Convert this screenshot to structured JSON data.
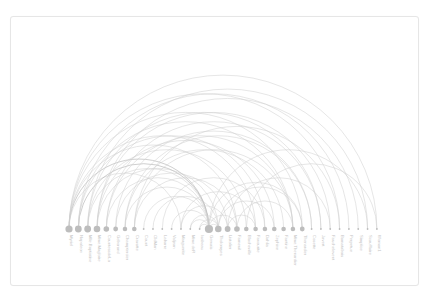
{
  "diagram": {
    "type": "arc-diagram",
    "colors": {
      "node": "#bdbdbd",
      "arc": "#cfcfcf",
      "label": "#c4c4c4",
      "border": "#e6e6e6"
    },
    "baseline_y": 229,
    "x_start": 69,
    "x_step": 9.33,
    "nodes": [
      {
        "label": "Myriel",
        "r": 3.6
      },
      {
        "label": "Napoleon",
        "r": 3.4
      },
      {
        "label": "Mlle.Baptistine",
        "r": 3.4
      },
      {
        "label": "Mme.Magloire",
        "r": 3.3
      },
      {
        "label": "CountessdeLo",
        "r": 2.8
      },
      {
        "label": "Geborand",
        "r": 2.4
      },
      {
        "label": "Champtercier",
        "r": 2.3
      },
      {
        "label": "Cravatte",
        "r": 2.3
      },
      {
        "label": "Count",
        "r": 0.9
      },
      {
        "label": "OldMan",
        "r": 0.9
      },
      {
        "label": "Labarre",
        "r": 0.9
      },
      {
        "label": "Valjean",
        "r": 0.9
      },
      {
        "label": "Marguerite",
        "r": 0.9
      },
      {
        "label": "Mme.deR",
        "r": 0.9
      },
      {
        "label": "Isabeau",
        "r": 0.9
      },
      {
        "label": "Gervais",
        "r": 4.1
      },
      {
        "label": "Tholomyes",
        "r": 3.3
      },
      {
        "label": "Listolier",
        "r": 2.9
      },
      {
        "label": "Fameuil",
        "r": 2.8
      },
      {
        "label": "Blacheville",
        "r": 2.3
      },
      {
        "label": "Favourite",
        "r": 2.3
      },
      {
        "label": "Dahlia",
        "r": 2.3
      },
      {
        "label": "Zephine",
        "r": 2.3
      },
      {
        "label": "Fantine",
        "r": 2.3
      },
      {
        "label": "Mme.Thenardier",
        "r": 2.3
      },
      {
        "label": "Thenardier",
        "r": 2.4
      },
      {
        "label": "Cosette",
        "r": 0.9
      },
      {
        "label": "Javert",
        "r": 0.9
      },
      {
        "label": "Fauchelevent",
        "r": 0.9
      },
      {
        "label": "Bamatabois",
        "r": 0.9
      },
      {
        "label": "Perpetue",
        "r": 0.9
      },
      {
        "label": "Simplice",
        "r": 0.9
      },
      {
        "label": "Scaufflaire",
        "r": 0.9
      },
      {
        "label": "Woman1",
        "r": 0.9
      }
    ],
    "links": [
      [
        0,
        25
      ],
      [
        0,
        33
      ],
      [
        0,
        15
      ],
      [
        0,
        20
      ],
      [
        0,
        18
      ],
      [
        0,
        12
      ],
      [
        1,
        15
      ],
      [
        1,
        24
      ],
      [
        1,
        30
      ],
      [
        2,
        15
      ],
      [
        2,
        19
      ],
      [
        2,
        27
      ],
      [
        3,
        16
      ],
      [
        3,
        22
      ],
      [
        3,
        31
      ],
      [
        4,
        15
      ],
      [
        4,
        24
      ],
      [
        5,
        17
      ],
      [
        5,
        26
      ],
      [
        6,
        15
      ],
      [
        6,
        23
      ],
      [
        7,
        18
      ],
      [
        7,
        29
      ],
      [
        8,
        15
      ],
      [
        9,
        16
      ],
      [
        10,
        21
      ],
      [
        11,
        15
      ],
      [
        12,
        20
      ],
      [
        13,
        15
      ],
      [
        14,
        15
      ],
      [
        15,
        25
      ],
      [
        15,
        32
      ],
      [
        16,
        25
      ],
      [
        17,
        28
      ],
      [
        18,
        24
      ],
      [
        19,
        33
      ],
      [
        0,
        29
      ],
      [
        2,
        32
      ],
      [
        3,
        28
      ],
      [
        1,
        21
      ],
      [
        4,
        27
      ],
      [
        6,
        26
      ],
      [
        7,
        24
      ],
      [
        16,
        22
      ],
      [
        17,
        20
      ],
      [
        15,
        18
      ],
      [
        13,
        16
      ],
      [
        12,
        17
      ],
      [
        14,
        16
      ],
      [
        15,
        16
      ]
    ],
    "strong_links": [
      [
        0,
        15
      ],
      [
        15,
        17
      ],
      [
        1,
        15
      ],
      [
        2,
        16
      ],
      [
        3,
        18
      ]
    ]
  }
}
